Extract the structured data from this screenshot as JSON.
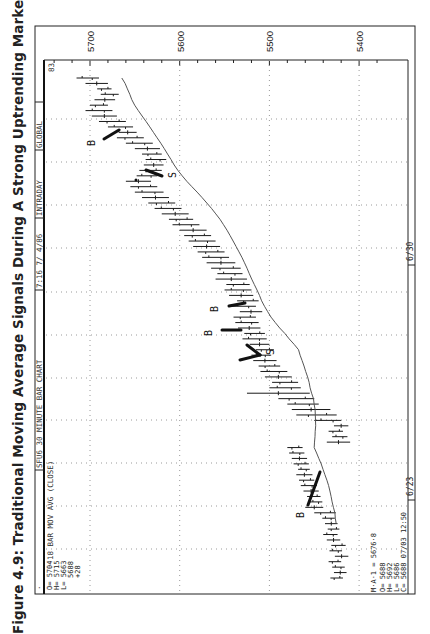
{
  "title": "Figure 4.9: Traditional Moving Average Signals During A Strong Uptrending Market.",
  "header": {
    "segments": [
      "SFU6 30 MINUTE BAR CHART",
      "7:16  7/ 4/86",
      "INTRADAY",
      "GLOBAL"
    ],
    "corner_number": "83",
    "dot": "·"
  },
  "study_label": "18 BAR MOV AVG (CLOSE)",
  "top_quote": {
    "O": "O= 5704",
    "H": "H= 5715",
    "L": "L= 5663",
    "C": "5688",
    "change": "+28"
  },
  "bottom_quote": {
    "ma": "M·A·1 = 5676·8",
    "O": "O= 5688",
    "H": "H= 5692",
    "L": "L= 5686",
    "C": "C= 5688  07/03   12:50"
  },
  "colors": {
    "ink": "#1a1a1a",
    "grid": "#9a9a9a",
    "background": "#ffffff"
  },
  "chart_data": {
    "type": "bar",
    "subtype": "ohlc-price-bars-with-moving-average (rotated 90° counter-clockwise)",
    "title": "Figure 4.9: Traditional Moving Average Signals During A Strong Uptrending Market.",
    "instrument": "SFU6 30 MINUTE BAR CHART",
    "xlabel": "Time (30-minute bars)",
    "ylabel": "Price",
    "price_ticks": [
      5700,
      5600,
      5500,
      5400
    ],
    "date_ticks": [
      "6/23",
      "6/30"
    ],
    "ylim": [
      5380,
      5735
    ],
    "grid": true,
    "moving_average": {
      "name": "18 BAR MOV AVG (CLOSE)",
      "last_value": 5676.8
    },
    "bars": [
      {
        "t": 0,
        "h": 5432,
        "l": 5418
      },
      {
        "t": 1,
        "h": 5428,
        "l": 5414
      },
      {
        "t": 2,
        "h": 5430,
        "l": 5416
      },
      {
        "t": 3,
        "h": 5434,
        "l": 5420
      },
      {
        "t": 4,
        "h": 5427,
        "l": 5412
      },
      {
        "t": 5,
        "h": 5433,
        "l": 5419
      },
      {
        "t": 6,
        "h": 5431,
        "l": 5415
      },
      {
        "t": 7,
        "h": 5436,
        "l": 5421
      },
      {
        "t": 8,
        "h": 5440,
        "l": 5424
      },
      {
        "t": 9,
        "h": 5435,
        "l": 5422
      },
      {
        "t": 10,
        "h": 5438,
        "l": 5424
      },
      {
        "t": 11,
        "h": 5441,
        "l": 5427
      },
      {
        "t": 12,
        "h": 5450,
        "l": 5426
      },
      {
        "t": 13,
        "h": 5460,
        "l": 5440
      },
      {
        "t": 14,
        "h": 5455,
        "l": 5441
      },
      {
        "t": 15,
        "h": 5458,
        "l": 5443
      },
      {
        "t": 16,
        "h": 5462,
        "l": 5445
      },
      {
        "t": 17,
        "h": 5465,
        "l": 5447
      },
      {
        "t": 18,
        "h": 5467,
        "l": 5450
      },
      {
        "t": 19,
        "h": 5470,
        "l": 5452
      },
      {
        "t": 20,
        "h": 5468,
        "l": 5455
      },
      {
        "t": 21,
        "h": 5473,
        "l": 5456
      },
      {
        "t": 22,
        "h": 5475,
        "l": 5458
      },
      {
        "t": 23,
        "h": 5478,
        "l": 5461
      },
      {
        "t": 24,
        "h": 5480,
        "l": 5463
      },
      {
        "t": 25,
        "h": 5436,
        "l": 5410
      },
      {
        "t": 26,
        "h": 5430,
        "l": 5413
      },
      {
        "t": 27,
        "h": 5434,
        "l": 5418
      },
      {
        "t": 28,
        "h": 5428,
        "l": 5412
      },
      {
        "t": 29,
        "h": 5450,
        "l": 5420
      },
      {
        "t": 30,
        "h": 5470,
        "l": 5425
      },
      {
        "t": 31,
        "h": 5475,
        "l": 5432
      },
      {
        "t": 32,
        "h": 5480,
        "l": 5445
      },
      {
        "t": 33,
        "h": 5490,
        "l": 5450
      },
      {
        "t": 34,
        "h": 5525,
        "l": 5455
      },
      {
        "t": 35,
        "h": 5500,
        "l": 5465
      },
      {
        "t": 36,
        "h": 5497,
        "l": 5468
      },
      {
        "t": 37,
        "h": 5505,
        "l": 5475
      },
      {
        "t": 38,
        "h": 5510,
        "l": 5480
      },
      {
        "t": 39,
        "h": 5512,
        "l": 5488
      },
      {
        "t": 40,
        "h": 5518,
        "l": 5492
      },
      {
        "t": 41,
        "h": 5520,
        "l": 5498
      },
      {
        "t": 42,
        "h": 5515,
        "l": 5495
      },
      {
        "t": 43,
        "h": 5522,
        "l": 5500
      },
      {
        "t": 44,
        "h": 5530,
        "l": 5503
      },
      {
        "t": 45,
        "h": 5528,
        "l": 5505
      },
      {
        "t": 46,
        "h": 5535,
        "l": 5510
      },
      {
        "t": 47,
        "h": 5538,
        "l": 5512
      },
      {
        "t": 48,
        "h": 5540,
        "l": 5515
      },
      {
        "t": 49,
        "h": 5533,
        "l": 5508
      },
      {
        "t": 50,
        "h": 5542,
        "l": 5515
      },
      {
        "t": 51,
        "h": 5536,
        "l": 5512
      },
      {
        "t": 52,
        "h": 5545,
        "l": 5518
      },
      {
        "t": 53,
        "h": 5550,
        "l": 5520
      },
      {
        "t": 54,
        "h": 5548,
        "l": 5522
      },
      {
        "t": 55,
        "h": 5560,
        "l": 5525
      },
      {
        "t": 56,
        "h": 5558,
        "l": 5530
      },
      {
        "t": 57,
        "h": 5565,
        "l": 5532
      },
      {
        "t": 58,
        "h": 5570,
        "l": 5538
      },
      {
        "t": 59,
        "h": 5575,
        "l": 5545
      },
      {
        "t": 60,
        "h": 5580,
        "l": 5550
      },
      {
        "t": 61,
        "h": 5585,
        "l": 5555
      },
      {
        "t": 62,
        "h": 5590,
        "l": 5560
      },
      {
        "t": 63,
        "h": 5595,
        "l": 5565
      },
      {
        "t": 64,
        "h": 5600,
        "l": 5570
      },
      {
        "t": 65,
        "h": 5608,
        "l": 5578
      },
      {
        "t": 66,
        "h": 5612,
        "l": 5585
      },
      {
        "t": 67,
        "h": 5620,
        "l": 5590
      },
      {
        "t": 68,
        "h": 5628,
        "l": 5598
      },
      {
        "t": 69,
        "h": 5635,
        "l": 5605
      },
      {
        "t": 70,
        "h": 5642,
        "l": 5612
      },
      {
        "t": 71,
        "h": 5650,
        "l": 5618
      },
      {
        "t": 72,
        "h": 5655,
        "l": 5625
      },
      {
        "t": 73,
        "h": 5660,
        "l": 5632
      },
      {
        "t": 74,
        "h": 5648,
        "l": 5625
      },
      {
        "t": 75,
        "h": 5645,
        "l": 5620
      },
      {
        "t": 76,
        "h": 5640,
        "l": 5618
      },
      {
        "t": 77,
        "h": 5638,
        "l": 5615
      },
      {
        "t": 78,
        "h": 5642,
        "l": 5620
      },
      {
        "t": 79,
        "h": 5650,
        "l": 5622
      },
      {
        "t": 80,
        "h": 5660,
        "l": 5630
      },
      {
        "t": 81,
        "h": 5670,
        "l": 5640
      },
      {
        "t": 82,
        "h": 5668,
        "l": 5648
      },
      {
        "t": 83,
        "h": 5680,
        "l": 5652
      },
      {
        "t": 84,
        "h": 5690,
        "l": 5660
      },
      {
        "t": 85,
        "h": 5698,
        "l": 5670
      },
      {
        "t": 86,
        "h": 5705,
        "l": 5675
      },
      {
        "t": 87,
        "h": 5700,
        "l": 5680
      },
      {
        "t": 88,
        "h": 5695,
        "l": 5672
      },
      {
        "t": 89,
        "h": 5688,
        "l": 5668
      },
      {
        "t": 90,
        "h": 5692,
        "l": 5676
      },
      {
        "t": 91,
        "h": 5705,
        "l": 5680
      },
      {
        "t": 92,
        "h": 5715,
        "l": 5690
      }
    ],
    "signals": [
      {
        "type": "B",
        "label": "B",
        "near_price": 5445,
        "note": "buy after bottom near 6/23"
      },
      {
        "type": "S",
        "label": "S",
        "near_price": 5520,
        "note": "sell on close below MA"
      },
      {
        "type": "B",
        "label": "B",
        "near_price": 5560,
        "note": "buy"
      },
      {
        "type": "B",
        "label": "B",
        "near_price": 5555,
        "note": "buy"
      },
      {
        "type": "S",
        "label": "S",
        "near_price": 5640,
        "note": "sell"
      },
      {
        "type": "B",
        "label": "B",
        "near_price": 5650,
        "note": "buy"
      }
    ]
  }
}
